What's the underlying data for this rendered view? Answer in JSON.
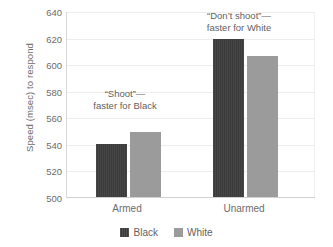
{
  "chart_data": {
    "type": "bar",
    "title": "",
    "xlabel": "",
    "ylabel": "Speed (msec) to respond",
    "categories": [
      "Armed",
      "Unarmed"
    ],
    "series": [
      {
        "name": "Black",
        "color": "#3b3b3b",
        "values": [
          540,
          619
        ]
      },
      {
        "name": "White",
        "color": "#9b9b9b",
        "values": [
          549,
          606
        ]
      }
    ],
    "ylim": [
      500,
      640
    ],
    "ytick_values": [
      500,
      520,
      540,
      560,
      580,
      600,
      620,
      640
    ],
    "ytick_labels": [
      "500",
      "520",
      "540",
      "560",
      "580",
      "600",
      "620",
      "640"
    ],
    "grid": true,
    "legend_position": "bottom",
    "annotations": [
      {
        "name": "annotation-armed",
        "line1": "“Shoot”—",
        "line2": "faster for Black"
      },
      {
        "name": "annotation-unarmed",
        "line1": "“Don’t shoot”—",
        "line2": "faster for White"
      }
    ]
  },
  "axes": {
    "y_title": "Speed (msec) to respond",
    "y_ticks": [
      {
        "label": "640",
        "value": 640
      },
      {
        "label": "620",
        "value": 620
      },
      {
        "label": "600",
        "value": 600
      },
      {
        "label": "580",
        "value": 580
      },
      {
        "label": "560",
        "value": 560
      },
      {
        "label": "540",
        "value": 540
      },
      {
        "label": "520",
        "value": 520
      },
      {
        "label": "500",
        "value": 500
      }
    ],
    "x_ticks": [
      {
        "label": "Armed"
      },
      {
        "label": "Unarmed"
      }
    ]
  },
  "legend": {
    "items": [
      {
        "label": "Black",
        "color": "#3b3b3b"
      },
      {
        "label": "White",
        "color": "#9b9b9b"
      }
    ]
  }
}
